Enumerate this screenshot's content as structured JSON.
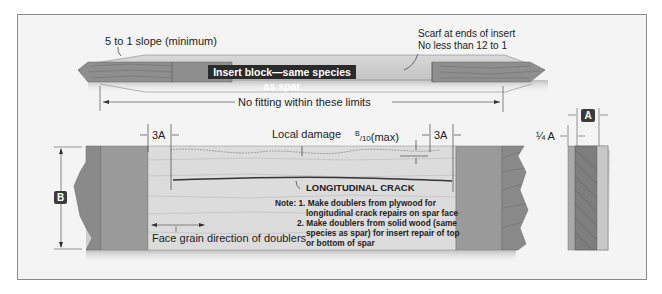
{
  "top_view": {
    "slope_label": "5 to 1 slope (minimum)",
    "scarf_label_line1": "Scarf at ends of insert",
    "scarf_label_line2": "No less than 12 to 1",
    "insert_label": "Insert block—same species as spar",
    "limits_label": "No fitting within these limits"
  },
  "side_view": {
    "dim_3a_left": "3A",
    "dim_3a_right": "3A",
    "local_damage": "Local damage",
    "max_label_num": "B",
    "max_label_den": "/10",
    "max_label_suffix": "(max)",
    "crack_label": "LONGITUDINAL CRACK",
    "b_badge": "B",
    "grain_label": "Face grain direction of doublers",
    "note_prefix": "Note: 1.",
    "note1_line1": "Make doublers from plywood for",
    "note1_line2": "longitudinal crack repairs on spar face",
    "note2_prefix": "2.",
    "note2_line1": "Make doublers from solid wood (same",
    "note2_line2": "species as spar) for insert repair of top",
    "note2_line3": "or bottom of spar"
  },
  "end_view": {
    "a_badge": "A",
    "quarter_a": "¼ A"
  }
}
